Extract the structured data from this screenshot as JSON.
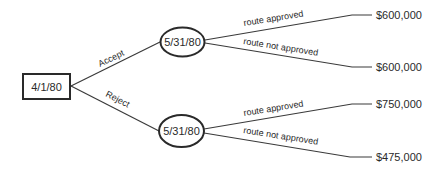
{
  "diagram": {
    "type": "decision-tree",
    "root": {
      "shape": "rectangle",
      "label": "4/1/80"
    },
    "decisions": [
      {
        "label": "Accept",
        "chance_node": {
          "shape": "ellipse",
          "label": "5/31/80"
        },
        "outcomes": [
          {
            "label": "route approved",
            "payoff": "$600,000"
          },
          {
            "label": "route not approved",
            "payoff": "$600,000"
          }
        ]
      },
      {
        "label": "Reject",
        "chance_node": {
          "shape": "ellipse",
          "label": "5/31/80"
        },
        "outcomes": [
          {
            "label": "route approved",
            "payoff": "$750,000"
          },
          {
            "label": "route not approved",
            "payoff": "$475,000"
          }
        ]
      }
    ]
  },
  "colors": {
    "line": "#3a3a3a",
    "text": "#2a2a2a",
    "background": "#ffffff"
  }
}
